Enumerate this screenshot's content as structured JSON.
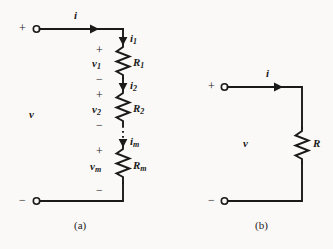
{
  "figure": {
    "background_color": "#faf9f7",
    "line_color": "#1a1a1a",
    "captions": {
      "a": "(a)",
      "b": "(b)"
    }
  },
  "circuit_a": {
    "caption": "(a)",
    "terminal_plus": "+",
    "terminal_minus": "−",
    "source_voltage": "v",
    "source_current": "i",
    "branches": [
      {
        "current": "i",
        "current_sub": "1",
        "voltage": "v",
        "voltage_sub": "1",
        "resistor": "R",
        "resistor_sub": "1",
        "polarity_top": "+",
        "polarity_bottom": "−"
      },
      {
        "current": "i",
        "current_sub": "2",
        "voltage": "v",
        "voltage_sub": "2",
        "resistor": "R",
        "resistor_sub": "2",
        "polarity_top": "+",
        "polarity_bottom": "−"
      },
      {
        "current": "i",
        "current_sub": "m",
        "voltage": "v",
        "voltage_sub": "m",
        "resistor": "R",
        "resistor_sub": "m",
        "polarity_top": "+",
        "polarity_bottom": "−"
      }
    ],
    "ellipsis_style": "vertical-dotted"
  },
  "circuit_b": {
    "caption": "(b)",
    "terminal_plus": "+",
    "terminal_minus": "−",
    "source_voltage": "v",
    "source_current": "i",
    "resistor": "R"
  }
}
